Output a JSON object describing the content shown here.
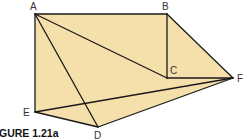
{
  "figure": {
    "caption": "GURE 1.21a",
    "fill_color": "#F5E0AC",
    "stroke_color": "#1a1a1a",
    "vertices": {
      "A": {
        "label": "A",
        "x": 35,
        "y": 14
      },
      "B": {
        "label": "B",
        "x": 167,
        "y": 14
      },
      "C": {
        "label": "C",
        "x": 167,
        "y": 78
      },
      "F": {
        "label": "F",
        "x": 233,
        "y": 78
      },
      "E": {
        "label": "E",
        "x": 35,
        "y": 112
      },
      "D": {
        "label": "D",
        "x": 98,
        "y": 127
      }
    },
    "edges": [
      [
        "A",
        "B"
      ],
      [
        "B",
        "C"
      ],
      [
        "C",
        "F"
      ],
      [
        "B",
        "F"
      ],
      [
        "A",
        "C"
      ],
      [
        "A",
        "E"
      ],
      [
        "A",
        "D"
      ],
      [
        "E",
        "D"
      ],
      [
        "E",
        "F"
      ],
      [
        "D",
        "F"
      ]
    ]
  }
}
